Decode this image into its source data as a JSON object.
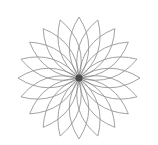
{
  "figure": {
    "type": "rosette-mandala",
    "background": "#ffffff",
    "center": [
      79,
      78
    ],
    "petal_count": 20,
    "petal_length": 61,
    "petal_bulge": 0.32,
    "start_angle_deg": -90,
    "stroke_color": "#8a8a8a",
    "stroke_width": 0.8,
    "core_color": "#4a4a4a",
    "core_radius": 3.5
  }
}
